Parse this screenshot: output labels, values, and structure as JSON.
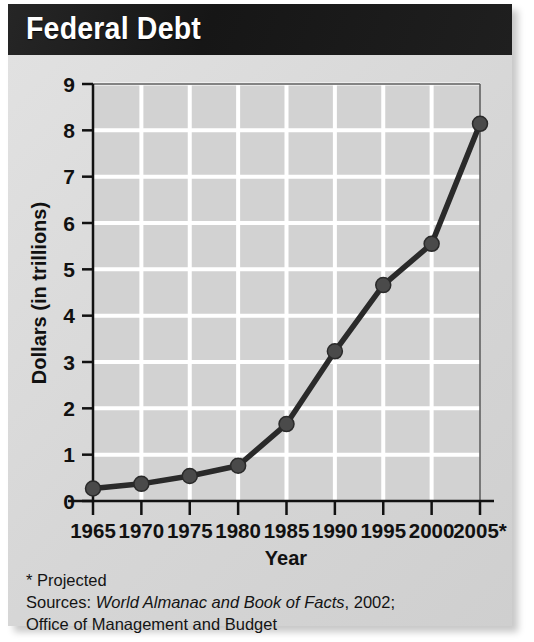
{
  "title": "Federal Debt",
  "footnotes": {
    "projected_note": "* Projected",
    "sources_label": "Sources:",
    "source_italic": "World Almanac and Book of Facts",
    "source_year": ", 2002;",
    "source_line2": "Office of Management and Budget"
  },
  "colors": {
    "banner_bg": "#1b1b1b",
    "banner_text": "#ffffff",
    "card_bg": "#dcdcdc",
    "plot_bg": "#d2d2d2",
    "gridline": "#ffffff",
    "axis": "#111111",
    "series_line": "#2a2a2a",
    "marker": "#4a4a4a"
  },
  "chart_data": {
    "type": "line",
    "title": "Federal Debt",
    "xlabel": "Year",
    "ylabel": "Dollars (in trillions)",
    "x": [
      1965,
      1970,
      1975,
      1980,
      1985,
      1990,
      1995,
      2000,
      2005
    ],
    "xtick_labels": [
      "1965",
      "1970",
      "1975",
      "1980",
      "1985",
      "1990",
      "1995",
      "2000",
      "2005*"
    ],
    "ytick_labels": [
      "0",
      "1",
      "2",
      "3",
      "4",
      "5",
      "6",
      "7",
      "8",
      "9"
    ],
    "values": [
      0.27,
      0.37,
      0.54,
      0.76,
      1.66,
      3.23,
      4.66,
      5.55,
      8.14
    ],
    "ylim": [
      0,
      9
    ],
    "xlim": [
      1965,
      2005
    ],
    "grid": true,
    "legend": "none",
    "markers": true,
    "annotations": [
      "* Projected"
    ]
  }
}
